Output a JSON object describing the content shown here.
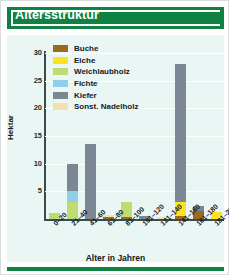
{
  "header": {
    "title": "Altersstruktur"
  },
  "colors": {
    "banner_green": "#0f8140",
    "panel_background": "#eaf6f4",
    "card_background": "#ffffff",
    "axis": "#3c4a4a",
    "gridline": "#ffffff",
    "Buche": "#9a6b1e",
    "Eiche": "#fbe322",
    "Weichlaubholz": "#bedc72",
    "Fichte": "#92cdea",
    "Kiefer": "#7b8894",
    "Sonst. Nadelholz": "#f6dfae"
  },
  "legend": {
    "position": "inside-top-left",
    "items": [
      {
        "label": "Buche",
        "color": "#9a6b1e"
      },
      {
        "label": "Eiche",
        "color": "#fbe322"
      },
      {
        "label": "Weichlaubholz",
        "color": "#bedc72"
      },
      {
        "label": "Fichte",
        "color": "#92cdea"
      },
      {
        "label": "Kiefer",
        "color": "#7b8894"
      },
      {
        "label": "Sonst. Nadelholz",
        "color": "#f6dfae"
      }
    ]
  },
  "chart_data": {
    "type": "bar",
    "stacked": true,
    "title": "Altersstruktur",
    "xlabel": "Alter in Jahren",
    "ylabel": "Hektar",
    "ylim": [
      0,
      30
    ],
    "yticks": [
      0,
      5,
      10,
      15,
      20,
      25,
      30
    ],
    "grid": true,
    "categories": [
      "0-20",
      "21-40",
      "41-60",
      "61-80",
      "81-100",
      "101-120",
      "121-140",
      "141-160",
      "161-180",
      "181-200"
    ],
    "series": [
      {
        "name": "Buche",
        "color": "#9a6b1e",
        "values": [
          0,
          0,
          0,
          0.4,
          0.4,
          0,
          0,
          0.6,
          1.4,
          0
        ]
      },
      {
        "name": "Eiche",
        "color": "#fbe322",
        "values": [
          0,
          0,
          0,
          0,
          0,
          0,
          0,
          2.4,
          0,
          1.2
        ]
      },
      {
        "name": "Weichlaubholz",
        "color": "#bedc72",
        "values": [
          1.0,
          3.0,
          0,
          0,
          2.6,
          0,
          0,
          0,
          0,
          0
        ]
      },
      {
        "name": "Fichte",
        "color": "#92cdea",
        "values": [
          0,
          2.0,
          0,
          0,
          0,
          0,
          0,
          0,
          0,
          0
        ]
      },
      {
        "name": "Kiefer",
        "color": "#7b8894",
        "values": [
          0,
          5.0,
          13.6,
          0,
          0,
          0.6,
          0,
          25.0,
          1.0,
          0
        ]
      },
      {
        "name": "Sonst. Nadelholz",
        "color": "#f6dfae",
        "values": [
          0,
          0,
          0,
          0.3,
          0,
          0,
          0.4,
          0,
          0,
          0
        ]
      }
    ],
    "totals": [
      1.0,
      10.0,
      13.6,
      0.7,
      3.0,
      0.6,
      0.4,
      28.0,
      2.4,
      1.2
    ]
  }
}
